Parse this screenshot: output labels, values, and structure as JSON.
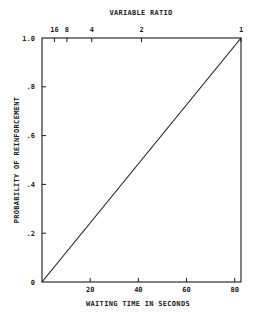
{
  "chart_data": {
    "type": "line",
    "title": "",
    "xlabel": "WAITING TIME IN SECONDS",
    "ylabel": "PROBABILITY OF REINFORCEMENT",
    "top_axis_label": "VARIABLE RATIO",
    "xlim": [
      0,
      82.6
    ],
    "ylim": [
      0,
      1.0
    ],
    "x_ticks": [
      20,
      40,
      60,
      80
    ],
    "x_tick_labels": [
      "20",
      "40",
      "60",
      "80"
    ],
    "y_ticks": [
      0,
      0.2,
      0.4,
      0.6,
      0.8,
      1.0
    ],
    "y_tick_labels": [
      "0",
      ".2",
      ".4",
      ".6",
      ".8",
      "1.0"
    ],
    "top_ticks_x_seconds": [
      5.16,
      10.33,
      20.65,
      41.3,
      82.6
    ],
    "top_tick_labels": [
      "16",
      "8",
      "4",
      "2",
      "1"
    ],
    "grid": false,
    "legend": null,
    "series": [
      {
        "name": "probability",
        "x": [
          0,
          82.6
        ],
        "y": [
          0,
          1.0
        ]
      }
    ]
  },
  "colors": {
    "ink": "#1a1a1a",
    "background": "#ffffff"
  }
}
